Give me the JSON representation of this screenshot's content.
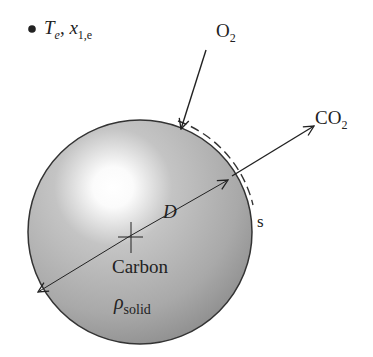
{
  "legend": {
    "bullet": "•",
    "symbol_T": "T",
    "sub_T": "e",
    "separator": ", ",
    "symbol_x": "x",
    "sub_x": "1,e"
  },
  "labels": {
    "o2": "O",
    "o2_sub": "2",
    "co2": "CO",
    "co2_sub": "2",
    "surface": "s",
    "diameter": "D",
    "material": "Carbon",
    "density_symbol": "ρ",
    "density_sub": "solid"
  },
  "colors": {
    "sphere_light": "#ffffff",
    "sphere_mid": "#b8b8b8",
    "sphere_dark": "#8a8a8a",
    "stroke": "#222222"
  }
}
